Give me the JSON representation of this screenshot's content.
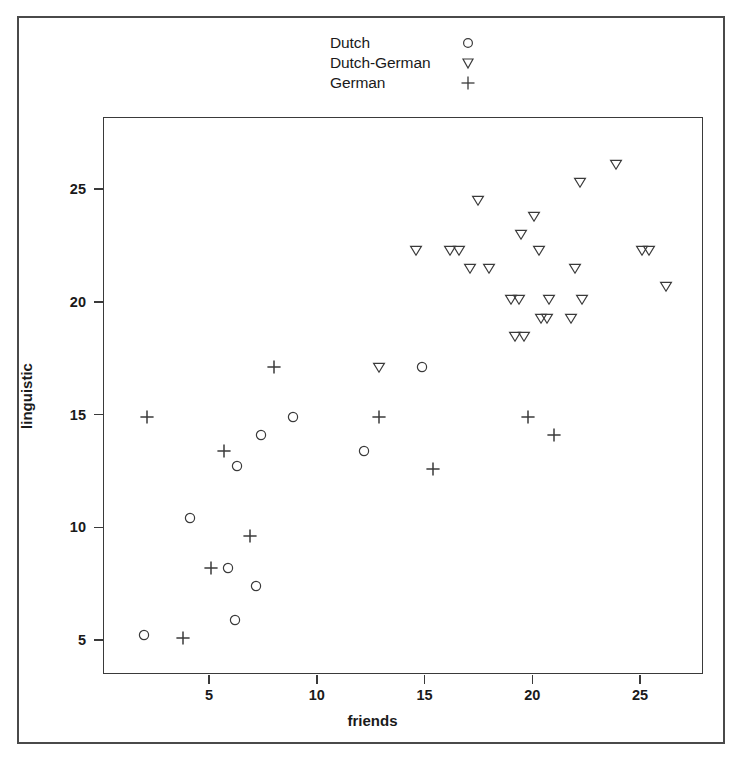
{
  "figure": {
    "background_color": "#ffffff",
    "frame_color": "#4a4a4a",
    "marker_color": "#3a3a3a"
  },
  "legend": {
    "position": "top-center",
    "entries": [
      {
        "label": "Dutch",
        "marker": "circle-icon"
      },
      {
        "label": "Dutch-German",
        "marker": "triangle-down-icon"
      },
      {
        "label": "German",
        "marker": "plus-icon"
      }
    ]
  },
  "axes": {
    "x": {
      "label": "friends",
      "ticks": [
        5,
        10,
        15,
        20,
        25
      ],
      "tick_labels": [
        "5",
        "10",
        "15",
        "20",
        "25"
      ],
      "range": [
        0.5,
        27.5
      ]
    },
    "y": {
      "label": "linguistic",
      "ticks": [
        5,
        10,
        15,
        20,
        25
      ],
      "tick_labels": [
        "5",
        "10",
        "15",
        "20",
        "25"
      ],
      "range": [
        4.0,
        28.5
      ]
    }
  },
  "chart_data": {
    "type": "scatter",
    "title": "",
    "xlabel": "friends",
    "ylabel": "linguistic",
    "xlim": [
      0.5,
      27.5
    ],
    "ylim": [
      4.0,
      28.5
    ],
    "grid": false,
    "legend_position": "top-center",
    "series": [
      {
        "name": "Dutch",
        "marker": "circle",
        "points": [
          [
            2.0,
            5.2
          ],
          [
            4.1,
            10.4
          ],
          [
            5.9,
            8.2
          ],
          [
            6.2,
            5.9
          ],
          [
            6.3,
            12.7
          ],
          [
            7.2,
            7.4
          ],
          [
            7.4,
            14.1
          ],
          [
            8.9,
            14.9
          ],
          [
            12.2,
            13.4
          ],
          [
            14.9,
            17.1
          ]
        ]
      },
      {
        "name": "Dutch-German",
        "marker": "triangle-down",
        "points": [
          [
            12.9,
            17.1
          ],
          [
            14.6,
            22.3
          ],
          [
            16.2,
            22.3
          ],
          [
            16.6,
            22.3
          ],
          [
            17.1,
            21.5
          ],
          [
            17.5,
            24.5
          ],
          [
            18.0,
            21.5
          ],
          [
            19.0,
            20.1
          ],
          [
            19.2,
            18.5
          ],
          [
            19.4,
            20.1
          ],
          [
            19.5,
            23.0
          ],
          [
            19.6,
            18.5
          ],
          [
            20.1,
            23.8
          ],
          [
            20.3,
            22.3
          ],
          [
            20.4,
            19.3
          ],
          [
            20.7,
            19.3
          ],
          [
            20.8,
            20.1
          ],
          [
            21.8,
            19.3
          ],
          [
            22.0,
            21.5
          ],
          [
            22.2,
            25.3
          ],
          [
            22.3,
            20.1
          ],
          [
            23.9,
            26.1
          ],
          [
            25.1,
            22.3
          ],
          [
            25.4,
            22.3
          ],
          [
            26.2,
            20.7
          ]
        ]
      },
      {
        "name": "German",
        "marker": "plus",
        "points": [
          [
            2.1,
            14.9
          ],
          [
            3.8,
            5.1
          ],
          [
            5.1,
            8.2
          ],
          [
            5.7,
            13.4
          ],
          [
            6.9,
            9.6
          ],
          [
            8.0,
            17.1
          ],
          [
            12.9,
            14.9
          ],
          [
            15.4,
            12.6
          ],
          [
            19.8,
            14.9
          ],
          [
            21.0,
            14.1
          ]
        ]
      }
    ]
  }
}
